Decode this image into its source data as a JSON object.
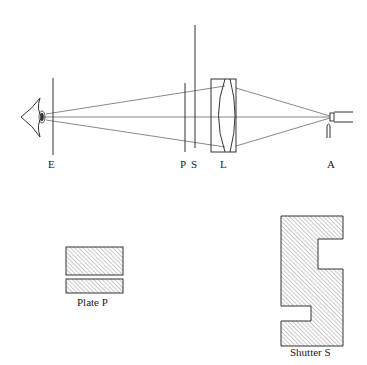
{
  "figure": {
    "labels": {
      "eye_stop": "E",
      "plate": "P",
      "shutter": "S",
      "lens": "L",
      "source": "A"
    },
    "captions": {
      "plate": "Plate P",
      "shutter": "Shutter S"
    },
    "colors": {
      "stroke": "#333333",
      "ray": "#555555",
      "hatch": "#777777",
      "background": "#ffffff"
    }
  }
}
